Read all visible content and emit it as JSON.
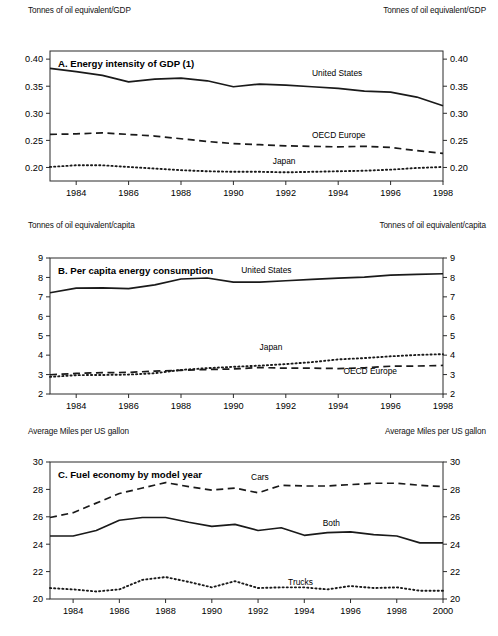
{
  "figure": {
    "width": 498,
    "height": 636,
    "background": "#ffffff",
    "line_color": "#1a1a1a",
    "frame_color": "#2b2b2b"
  },
  "panels": [
    {
      "id": "panel-a",
      "unit_left": "Tonnes of oil equivalent/GDP",
      "unit_right": "Tonnes of oil equivalent/GDP"
    },
    {
      "id": "panel-b",
      "unit_left": "Tonnes of oil equivalent/capita",
      "unit_right": "Tonnes of oil equivalent/capita"
    },
    {
      "id": "panel-c",
      "unit_left": "Average Miles per US gallon",
      "unit_right": "Average Miles per US gallon"
    }
  ],
  "chart_data": [
    {
      "id": "panel-a",
      "type": "line",
      "title": "A. Energy intensity of GDP (1)",
      "xlabel": "",
      "ylabel": "Tonnes of oil equivalent/GDP",
      "x": [
        1983,
        1984,
        1985,
        1986,
        1987,
        1988,
        1989,
        1990,
        1991,
        1992,
        1993,
        1994,
        1995,
        1996,
        1997,
        1998
      ],
      "xlim": [
        1983,
        1998
      ],
      "xticks": [
        1984,
        1986,
        1988,
        1990,
        1992,
        1994,
        1996,
        1998
      ],
      "xticklabels": [
        "1984",
        "1986",
        "1988",
        "1990",
        "1992",
        "1994",
        "1996",
        "1998"
      ],
      "ylim": [
        0.175,
        0.415
      ],
      "yticks": [
        0.2,
        0.25,
        0.3,
        0.35,
        0.4
      ],
      "yticklabels": [
        "0.20",
        "0.25",
        "0.30",
        "0.35",
        "0.40"
      ],
      "grid": false,
      "legend": "inline-annotations",
      "series": [
        {
          "name": "United States",
          "style": "solid",
          "label_x": 1993.0,
          "label_y": 0.368,
          "values": [
            0.383,
            0.377,
            0.37,
            0.358,
            0.363,
            0.365,
            0.36,
            0.349,
            0.354,
            0.352,
            0.349,
            0.346,
            0.341,
            0.339,
            0.33,
            0.314
          ]
        },
        {
          "name": "OECD Europe",
          "style": "dashed",
          "label_x": 1993.0,
          "label_y": 0.2545,
          "values": [
            0.261,
            0.262,
            0.264,
            0.261,
            0.258,
            0.253,
            0.248,
            0.244,
            0.242,
            0.24,
            0.239,
            0.238,
            0.239,
            0.237,
            0.231,
            0.226
          ]
        },
        {
          "name": "Japan",
          "style": "dotted",
          "label_x": 1991.5,
          "label_y": 0.2065,
          "values": [
            0.201,
            0.204,
            0.204,
            0.201,
            0.198,
            0.195,
            0.193,
            0.192,
            0.192,
            0.191,
            0.192,
            0.193,
            0.194,
            0.196,
            0.199,
            0.201
          ]
        }
      ]
    },
    {
      "id": "panel-b",
      "type": "line",
      "title": "B. Per capita energy consumption",
      "xlabel": "",
      "ylabel": "Tonnes of oil equivalent/capita",
      "x": [
        1983,
        1984,
        1985,
        1986,
        1987,
        1988,
        1989,
        1990,
        1991,
        1992,
        1993,
        1994,
        1995,
        1996,
        1997,
        1998
      ],
      "xlim": [
        1983,
        1998
      ],
      "xticks": [
        1984,
        1986,
        1988,
        1990,
        1992,
        1994,
        1996,
        1998
      ],
      "xticklabels": [
        "1984",
        "1986",
        "1988",
        "1990",
        "1992",
        "1994",
        "1996",
        "1998"
      ],
      "ylim": [
        2,
        9
      ],
      "yticks": [
        2,
        3,
        4,
        5,
        6,
        7,
        8,
        9
      ],
      "yticklabels": [
        "2",
        "3",
        "4",
        "5",
        "6",
        "7",
        "8",
        "9"
      ],
      "grid": false,
      "legend": "inline-annotations",
      "series": [
        {
          "name": "United States",
          "style": "solid",
          "label_x": 1990.3,
          "label_y": 8.25,
          "values": [
            7.21,
            7.45,
            7.46,
            7.42,
            7.62,
            7.92,
            7.97,
            7.76,
            7.76,
            7.83,
            7.9,
            7.96,
            8.02,
            8.12,
            8.16,
            8.19
          ]
        },
        {
          "name": "Japan",
          "style": "dotted",
          "label_x": 1991.0,
          "label_y": 4.28,
          "values": [
            2.88,
            2.97,
            2.98,
            3.0,
            3.07,
            3.24,
            3.33,
            3.4,
            3.46,
            3.54,
            3.64,
            3.78,
            3.85,
            3.94,
            4.01,
            4.05
          ]
        },
        {
          "name": "OECD Europe",
          "style": "dashed",
          "label_x": 1994.2,
          "label_y": 3.02,
          "values": [
            2.99,
            3.06,
            3.1,
            3.11,
            3.18,
            3.22,
            3.26,
            3.29,
            3.36,
            3.33,
            3.33,
            3.31,
            3.35,
            3.43,
            3.44,
            3.47
          ]
        }
      ]
    },
    {
      "id": "panel-c",
      "type": "line",
      "title": "C. Fuel economy by model year",
      "xlabel": "",
      "ylabel": "Average Miles per US gallon",
      "x": [
        1983,
        1984,
        1985,
        1986,
        1987,
        1988,
        1989,
        1990,
        1991,
        1992,
        1993,
        1994,
        1995,
        1996,
        1997,
        1998,
        1999,
        2000
      ],
      "xlim": [
        1983,
        2000
      ],
      "xticks": [
        1984,
        1986,
        1988,
        1990,
        1992,
        1994,
        1996,
        1998,
        2000
      ],
      "xticklabels": [
        "1984",
        "1986",
        "1988",
        "1990",
        "1992",
        "1994",
        "1996",
        "1998",
        "2000"
      ],
      "ylim": [
        20,
        30
      ],
      "yticks": [
        20,
        22,
        24,
        26,
        28,
        30
      ],
      "yticklabels": [
        "20",
        "22",
        "24",
        "26",
        "28",
        "30"
      ],
      "grid": false,
      "legend": "inline-annotations",
      "series": [
        {
          "name": "Cars",
          "style": "dashed",
          "label_x": 1991.7,
          "label_y": 28.72,
          "values": [
            25.95,
            26.3,
            27.0,
            27.7,
            28.1,
            28.5,
            28.2,
            27.95,
            28.1,
            27.75,
            28.3,
            28.25,
            28.25,
            28.35,
            28.45,
            28.45,
            28.3,
            28.2
          ]
        },
        {
          "name": "Both",
          "style": "solid",
          "label_x": 1994.8,
          "label_y": 25.35,
          "values": [
            24.6,
            24.6,
            25.0,
            25.75,
            25.95,
            25.95,
            25.6,
            25.3,
            25.45,
            25.0,
            25.2,
            24.65,
            24.85,
            24.9,
            24.7,
            24.6,
            24.1,
            24.1
          ]
        },
        {
          "name": "Trucks",
          "style": "dotted",
          "label_x": 1993.3,
          "label_y": 21.05,
          "values": [
            20.8,
            20.7,
            20.55,
            20.7,
            21.4,
            21.6,
            21.25,
            20.85,
            21.3,
            20.8,
            20.85,
            20.85,
            20.7,
            20.95,
            20.8,
            20.85,
            20.6,
            20.6
          ]
        }
      ]
    }
  ]
}
